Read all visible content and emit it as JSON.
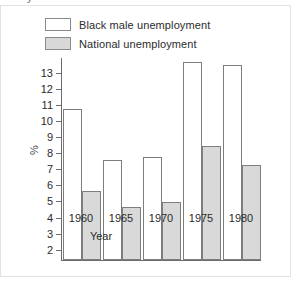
{
  "top_artifact": {
    "text": "y"
  },
  "legend": {
    "position": "top-left",
    "items": [
      {
        "label": "Black male unemployment",
        "swatch": "white-square-icon",
        "color": "#ffffff"
      },
      {
        "label": "National unemployment",
        "swatch": "gray-square-icon",
        "color": "#d9d9d9"
      }
    ]
  },
  "chart_data": {
    "type": "bar",
    "title": "",
    "categories": [
      "1960",
      "1965",
      "1970",
      "1975",
      "1980"
    ],
    "series": [
      {
        "name": "Black male unemployment",
        "values": [
          10.7,
          7.5,
          7.7,
          13.6,
          13.4
        ],
        "color": "#ffffff"
      },
      {
        "name": "National unemployment",
        "values": [
          5.6,
          4.6,
          4.9,
          8.4,
          7.2
        ],
        "color": "#d9d9d9"
      }
    ],
    "xlabel": "Year",
    "ylabel": "%",
    "ylim": [
      1.3,
      13.9
    ],
    "yticks": [
      2,
      3,
      4,
      5,
      6,
      7,
      8,
      9,
      10,
      11,
      12,
      13
    ],
    "ytick_labels": [
      "2",
      "3",
      "4",
      "5",
      "6",
      "7",
      "8",
      "9",
      "10",
      "11",
      "12",
      "13"
    ],
    "grid": false,
    "legend_position": "top-left"
  }
}
